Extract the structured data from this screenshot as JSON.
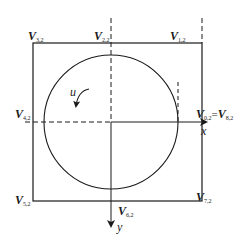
{
  "diagram": {
    "type": "geometric-figure",
    "colors": {
      "stroke": "#1a1a1a",
      "background": "#ffffff"
    },
    "labels": {
      "v32": {
        "main": "V",
        "sub": "3,2"
      },
      "v22": {
        "main": "V",
        "sub": "2,2"
      },
      "v12": {
        "main": "V",
        "sub": "1,2"
      },
      "v42": {
        "main": "V",
        "sub": "4,2"
      },
      "v02_left": {
        "main": "V",
        "sub": "0,2"
      },
      "equals": "=",
      "v82": {
        "main": "V",
        "sub": "8,2"
      },
      "v52": {
        "main": "V",
        "sub": "5,2"
      },
      "v62": {
        "main": "V",
        "sub": "6,2"
      },
      "v72": {
        "main": "V",
        "sub": "7,2"
      },
      "rotation": "u",
      "x_axis": "x",
      "y_axis": "y"
    }
  }
}
